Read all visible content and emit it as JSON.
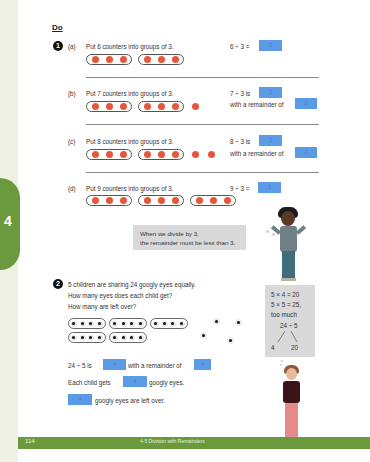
{
  "section_title": "Do",
  "chapter_tab": "4",
  "footer": {
    "page_number": "114",
    "title": "4-5 Division with Remainders"
  },
  "question1": {
    "number": "1",
    "parts": [
      {
        "label": "(a)",
        "prompt": "Put 6 counters into groups of 3.",
        "equation": "6 ÷ 3 =",
        "answer": "2",
        "groups": 2,
        "loose": 0
      },
      {
        "label": "(b)",
        "prompt": "Put 7 counters into groups of 3.",
        "equation": "7 ÷ 3 is",
        "answer": "2",
        "remainder_text": "with a remainder of",
        "remainder": "1",
        "groups": 2,
        "loose": 1
      },
      {
        "label": "(c)",
        "prompt": "Put 8 counters into groups of 3.",
        "equation": "8 ÷ 3 is",
        "answer": "2",
        "remainder_text": "with a remainder of",
        "remainder": "2",
        "groups": 2,
        "loose": 2
      },
      {
        "label": "(d)",
        "prompt": "Put 9 counters into groups of 3.",
        "equation": "9 ÷ 3 =",
        "answer": "3",
        "groups": 3,
        "loose": 0
      }
    ]
  },
  "speech_bubble": {
    "line1": "When we divide by 3,",
    "line2": "the remainder must be less than 3."
  },
  "question2": {
    "number": "2",
    "line1": "5 children are sharing 24 googly eyes equally.",
    "line2": "How many eyes does each child get?",
    "line3": "How many are left over?",
    "statement1_prefix": "24 ÷ 5 is",
    "statement1_answer": "4",
    "statement1_mid": "with a remainder of",
    "statement1_remainder": "4",
    "statement2_prefix": "Each child gets",
    "statement2_answer": "4",
    "statement2_suffix": "googly eyes.",
    "statement3_answer": "4",
    "statement3_suffix": "googly eyes are left over."
  },
  "calc_box": {
    "line1": "5 × 4 = 20",
    "line2": "5 × 5 = 25,",
    "line3": "too much",
    "line4": "24 ÷ 5",
    "split_left": "4",
    "split_right": "20"
  }
}
